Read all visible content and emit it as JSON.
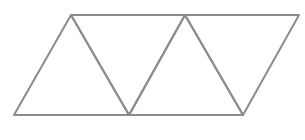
{
  "diagram": {
    "background": "#ffffff",
    "stroke_color": "#8c8c8c",
    "stroke_width": 2,
    "vertices": {
      "top": [
        [
          71,
          15
        ],
        [
          185,
          15
        ],
        [
          299,
          15
        ]
      ],
      "bottom": [
        [
          14,
          115
        ],
        [
          129,
          115
        ],
        [
          243,
          115
        ]
      ]
    },
    "triangles": [
      {
        "id": "t1",
        "orientation": "up",
        "points": "14,115 71,15 129,115"
      },
      {
        "id": "t2",
        "orientation": "down",
        "points": "71,15 185,15 129,115"
      },
      {
        "id": "t3",
        "orientation": "up",
        "points": "129,115 185,15 243,115"
      },
      {
        "id": "t4",
        "orientation": "down",
        "points": "185,15 299,15 243,115"
      }
    ]
  }
}
